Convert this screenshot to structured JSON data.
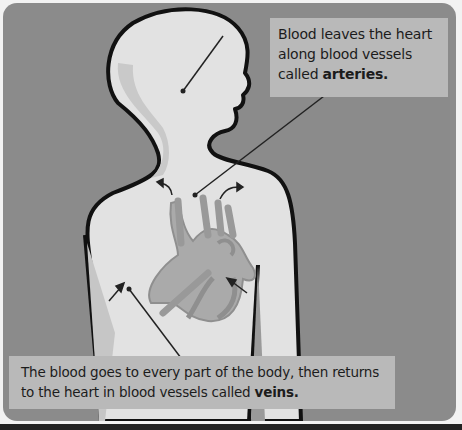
{
  "diagram": {
    "callouts": {
      "arteries": {
        "text": "Blood leaves the heart along blood vessels called ",
        "bold": "arteries",
        "end": "."
      },
      "veins": {
        "text": "The blood goes to every part of the body, then returns to the heart in blood vessels called ",
        "bold": "veins",
        "end": "."
      }
    },
    "colors": {
      "panel": "#8b8b8b",
      "body": "#e2e2e2",
      "body_shadow": "#c8c8c8",
      "heart": "#a9a9a9",
      "heart_dark": "#8f8f8f",
      "callout_bg": "#b9b9b9",
      "outline": "#111111"
    }
  }
}
